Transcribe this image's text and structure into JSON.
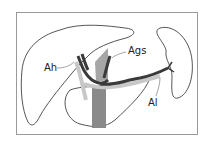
{
  "figure": {
    "type": "anatomical-diagram",
    "labels": [
      {
        "id": "ah",
        "text": "Ah"
      },
      {
        "id": "ags",
        "text": "Ags"
      },
      {
        "id": "al",
        "text": "Al"
      }
    ]
  },
  "colors": {
    "outline": "#2a2a2a",
    "vessel_dark": "#3a3a3a",
    "vessel_mid": "#8c8c8c",
    "vessel_light": "#c8c8c8",
    "aorta": "#8a8a8a",
    "frame": "#9a9a9a"
  }
}
